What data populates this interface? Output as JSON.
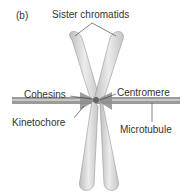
{
  "panel": "(b)",
  "labels": {
    "sister": "Sister chromatids",
    "cohesins": "Cohesins",
    "centromere": "Centromere",
    "kinetochore": "Kinetochore",
    "microtubule": "Microtubule"
  },
  "colors": {
    "chromatid": "#d8d8d8",
    "kinetochore": "#8e8e8e",
    "microtubule": "#9a9a9a"
  }
}
